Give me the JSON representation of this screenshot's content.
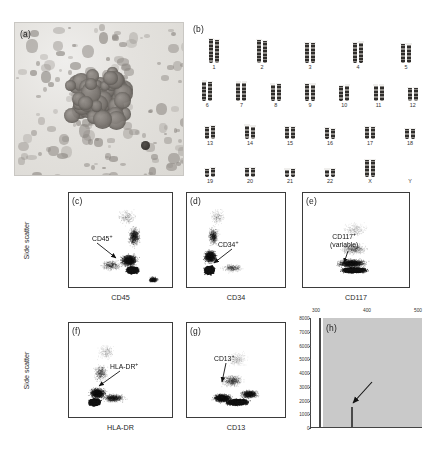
{
  "figure": {
    "panels": [
      {
        "id": "a",
        "label": "(a)",
        "type": "micrograph"
      },
      {
        "id": "b",
        "label": "(b)",
        "type": "karyotype"
      },
      {
        "id": "c",
        "label": "(c)",
        "type": "scatter"
      },
      {
        "id": "d",
        "label": "(d)",
        "type": "scatter"
      },
      {
        "id": "e",
        "label": "(e)",
        "type": "scatter"
      },
      {
        "id": "f",
        "label": "(f)",
        "type": "scatter"
      },
      {
        "id": "g",
        "label": "(g)",
        "type": "scatter"
      },
      {
        "id": "h",
        "label": "(h)",
        "type": "histogram"
      }
    ]
  },
  "panel_a": {
    "label": "(a)",
    "description": "Bone marrow aspirate smear micrograph"
  },
  "panel_b": {
    "label": "(b)",
    "rows": [
      {
        "numbers": [
          "1",
          "2",
          "3",
          "4",
          "5"
        ]
      },
      {
        "numbers": [
          "6",
          "7",
          "8",
          "9",
          "10",
          "11",
          "12"
        ]
      },
      {
        "numbers": [
          "13",
          "14",
          "15",
          "16",
          "17",
          "18"
        ]
      },
      {
        "numbers": [
          "19",
          "20",
          "21",
          "22",
          "X",
          "Y"
        ]
      }
    ]
  },
  "panel_c": {
    "label": "(c)",
    "xlabel": "CD45",
    "ylabel": "Side scatter",
    "annotation": "CD45",
    "annotation_sup": "+"
  },
  "panel_d": {
    "label": "(d)",
    "xlabel": "CD34",
    "annotation": "CD34",
    "annotation_sup": "+"
  },
  "panel_e": {
    "label": "(e)",
    "xlabel": "CD117",
    "annotation": "CD117",
    "annotation_sup": "+",
    "annotation_line2": "(variable)"
  },
  "panel_f": {
    "label": "(f)",
    "xlabel": "HLA-DR",
    "ylabel": "Side scatter",
    "annotation": "HLA-DR",
    "annotation_sup": "+"
  },
  "panel_g": {
    "label": "(g)",
    "xlabel": "CD13",
    "annotation": "CD13",
    "annotation_sup": "+"
  },
  "panel_h": {
    "label": "(h)",
    "y_ticks": [
      "8000",
      "7000",
      "6000",
      "5000",
      "4000",
      "3000",
      "2000",
      "1000",
      "0"
    ],
    "x_ticks": [
      "300",
      "400",
      "500"
    ]
  },
  "chart_data": [
    {
      "type": "scatter",
      "panel": "c",
      "title": "(c)",
      "xlabel": "CD45",
      "ylabel": "Side scatter",
      "annotations": [
        "CD45+"
      ],
      "grid": false,
      "legend": "none",
      "cluster_description": "dense population lower-center-right, sparse tail upward"
    },
    {
      "type": "scatter",
      "panel": "d",
      "title": "(d)",
      "xlabel": "CD34",
      "ylabel": "Side scatter",
      "annotations": [
        "CD34+"
      ],
      "grid": false,
      "legend": "none",
      "cluster_description": "dense population lower-left with vertical spread"
    },
    {
      "type": "scatter",
      "panel": "e",
      "title": "(e)",
      "xlabel": "CD117",
      "ylabel": "Side scatter",
      "annotations": [
        "CD117+",
        "(variable)"
      ],
      "grid": false,
      "legend": "none",
      "cluster_description": "broad horizontal band across lower third"
    },
    {
      "type": "scatter",
      "panel": "f",
      "title": "(f)",
      "xlabel": "HLA-DR",
      "ylabel": "Side scatter",
      "annotations": [
        "HLA-DR+"
      ],
      "grid": false,
      "legend": "none",
      "cluster_description": "dense lower-left cluster with rightward tail"
    },
    {
      "type": "scatter",
      "panel": "g",
      "title": "(g)",
      "xlabel": "CD13",
      "ylabel": "Side scatter",
      "annotations": [
        "CD13+"
      ],
      "grid": false,
      "legend": "none",
      "cluster_description": "diagonal elongated band lower-left to center-right"
    },
    {
      "type": "line",
      "panel": "h",
      "title": "(h)",
      "xlabel": "",
      "ylabel": "",
      "x": [
        300,
        400,
        500
      ],
      "ylim": [
        0,
        8000
      ],
      "yticks": [
        0,
        1000,
        2000,
        3000,
        4000,
        5000,
        6000,
        7000,
        8000
      ],
      "xticks": [
        300,
        400,
        500
      ],
      "peaks": [
        {
          "x": 318,
          "height": 8000
        },
        {
          "x": 352,
          "height": 1450
        }
      ],
      "annotations": [
        "arrow to second peak"
      ],
      "grid": false,
      "legend": "none"
    }
  ]
}
